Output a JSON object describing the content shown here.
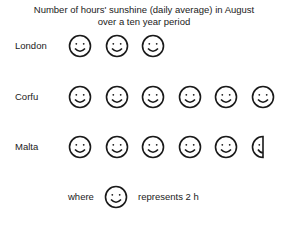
{
  "chart_data": {
    "type": "pictogram",
    "title": "Number of hours' sunshine (daily average) in August",
    "subtitle": "over a ten year period",
    "unit": "h",
    "icon": "smiley-face-icon",
    "icon_value": 2,
    "categories": [
      "London",
      "Corfu",
      "Malta"
    ],
    "values": [
      6,
      12,
      11
    ],
    "icon_counts": [
      3,
      6,
      5.5
    ],
    "legend": {
      "prefix": "where",
      "suffix": "represents 2 h"
    }
  },
  "colors": {
    "ink": "#1a1a1a",
    "background": "#ffffff"
  }
}
